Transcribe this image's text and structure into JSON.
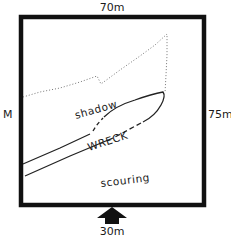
{
  "diagram": {
    "type": "site-plan",
    "frame": {
      "top_label": "70m",
      "left_label": "M",
      "right_label": "75m",
      "bottom_label": "30m",
      "border_color": "#111111"
    },
    "regions": {
      "shadow_label": "shadow",
      "wreck_label": "WRECK",
      "scouring_label": "scouring"
    },
    "arrow": {
      "direction": "up",
      "icon": "arrow-up-icon",
      "color": "#111111"
    },
    "line_color": "#222222",
    "shadow_line_color": "#777777"
  }
}
